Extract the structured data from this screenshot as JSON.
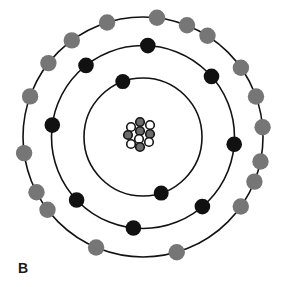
{
  "figure": {
    "label": "B",
    "type": "bohr-atom-model"
  },
  "colors": {
    "background": "#ffffff",
    "orbit_stroke": "#121212",
    "black_electron": "#111111",
    "gray_electron": "#767676",
    "nucleus_gray": "#6b6b6b",
    "nucleus_white": "#ffffff",
    "nucleus_stroke": "#141414",
    "label_color": "#1a1a1a"
  },
  "diagram": {
    "center": {
      "x": 143,
      "y": 137
    },
    "orbit_stroke_width": 1.6,
    "shells": [
      {
        "name": "shell-1-inner",
        "radius": 59,
        "electron_color": "#111111",
        "electron_radius": 7.5,
        "electron_count": 2,
        "electron_angles_deg": [
          162,
          340
        ]
      },
      {
        "name": "shell-2-middle",
        "radius": 91.5,
        "electron_color": "#111111",
        "electron_radius": 7.8,
        "electron_count": 8,
        "electron_angles_deg": [
          3,
          48.5,
          94.5,
          139.5,
          186,
          226.5,
          277.5,
          321.5
        ]
      },
      {
        "name": "shell-3-outer",
        "radius": 120,
        "electron_color": "#767676",
        "electron_radius": 8.2,
        "electron_count": 18,
        "electron_angles_deg": [
          6.7,
          21.5,
          32.5,
          54.7,
          70.3,
          85.3,
          101.8,
          111.8,
          125.4,
          163.7,
          203,
          232.7,
          242.6,
          262.3,
          289.8,
          308,
          323.6,
          342.6
        ]
      }
    ],
    "nucleus": {
      "center": {
        "x": 140,
        "y": 135
      },
      "particle_radius": 4.3,
      "particle_stroke_width": 1.6,
      "particles": [
        {
          "dx": 0,
          "dy": -13,
          "fill": "gray"
        },
        {
          "dx": 10,
          "dy": -10,
          "fill": "white"
        },
        {
          "dx": -9,
          "dy": -8,
          "fill": "white"
        },
        {
          "dx": 0,
          "dy": -4,
          "fill": "gray"
        },
        {
          "dx": 10,
          "dy": -1,
          "fill": "gray"
        },
        {
          "dx": -12,
          "dy": 0,
          "fill": "gray"
        },
        {
          "dx": -1,
          "dy": 4,
          "fill": "white"
        },
        {
          "dx": 9,
          "dy": 7,
          "fill": "white"
        },
        {
          "dx": -9,
          "dy": 9,
          "fill": "white"
        },
        {
          "dx": 0,
          "dy": 12,
          "fill": "gray"
        }
      ]
    }
  }
}
